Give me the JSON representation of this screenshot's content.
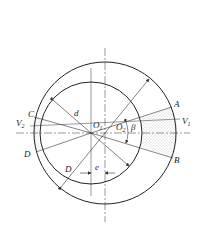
{
  "diagram": {
    "type": "eccentric-circles-cross-section",
    "colors": {
      "line": "#333333",
      "fill_dots": "#9a9a9a",
      "background": "#ffffff"
    },
    "labels": {
      "A": "A",
      "B": "B",
      "C": "C",
      "D_point": "D",
      "V1": "V",
      "V1_sub": "1",
      "V2": "V",
      "V2_sub": "2",
      "d": "d",
      "D_diam": "D",
      "O1": "O",
      "O1_sub": "1",
      "O2": "O",
      "O2_sub": "2",
      "beta": "β",
      "e": "e"
    }
  }
}
